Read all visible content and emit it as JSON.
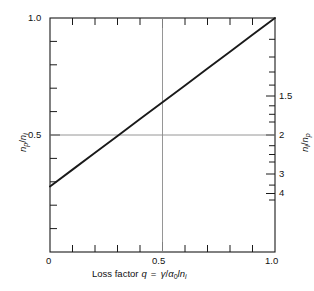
{
  "chart_data": {
    "type": "line",
    "title": "",
    "subtitle": "",
    "xlabel_text": "Loss factor",
    "xlabel_symbol": "q",
    "xlabel_equals": "=",
    "xlabel_formula_num": "γ",
    "xlabel_formula_slash": "/",
    "xlabel_formula_alpha": "α",
    "xlabel_formula_alpha_sub": "0",
    "xlabel_formula_l": "l",
    "xlabel_formula_n": "n",
    "xlabel_formula_n_sub": "i",
    "xlabel_full": "Loss factor q = γ/α0ln i",
    "ylabel_left_num": "n",
    "ylabel_left_num_sub": "p",
    "ylabel_left_slash": "/",
    "ylabel_left_den": "n",
    "ylabel_left_den_sub": "i",
    "ylabel_left_full": "np/ni",
    "ylabel_right_num": "n",
    "ylabel_right_num_sub": "i",
    "ylabel_right_slash": "/",
    "ylabel_right_den": "n",
    "ylabel_right_den_sub": "p",
    "ylabel_right_full": "ni/np",
    "x_tick_labels": [
      "0",
      "0.5",
      "1.0"
    ],
    "x_tick_values": [
      0,
      0.5,
      1.0
    ],
    "x_minor_step": 0.1,
    "xlim": [
      0,
      1.0
    ],
    "y_tick_labels": [
      "0.5",
      "1.0"
    ],
    "y_tick_values": [
      0.5,
      1.0
    ],
    "y_minor_step": 0.1,
    "ylim": [
      0,
      1.0
    ],
    "right_axis_tick_labels": [
      "1.5",
      "2",
      "3",
      "4"
    ],
    "right_axis_tick_values": [
      0.6667,
      0.5,
      0.3333,
      0.25
    ],
    "right_axis_minor_values": [
      0.9091,
      0.8333,
      0.7692,
      0.7143,
      0.625,
      0.5882,
      0.5556,
      0.4545,
      0.4167,
      0.3846,
      0.2857,
      0.2222
    ],
    "grid": {
      "horizontal_at": 0.5,
      "vertical_at": 0.5,
      "color": "#8a8a8a"
    },
    "series": [
      {
        "name": "np/ni vs q",
        "color": "#1a1a1a",
        "x": [
          0,
          0.1,
          0.2,
          0.3,
          0.4,
          0.5,
          0.6,
          0.7,
          0.8,
          0.9,
          1.0
        ],
        "values": [
          0.28,
          0.352,
          0.424,
          0.496,
          0.568,
          0.64,
          0.712,
          0.784,
          0.856,
          0.928,
          1.0
        ]
      }
    ],
    "legend_position": "none",
    "frame_color": "#1a1a1a"
  },
  "figure": {
    "background_color": "#ffffff",
    "text_color": "#1a1a1a"
  }
}
